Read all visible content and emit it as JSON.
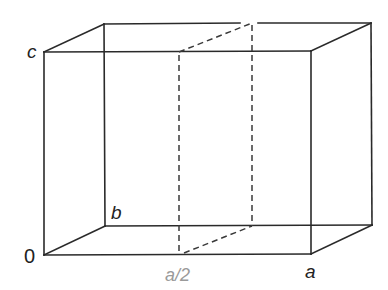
{
  "diagram": {
    "type": "unit-cell-box",
    "colors": {
      "edges": "#2a2a2a",
      "dashed_plane": "#3a3a3a",
      "half_label": "#9a9a9a",
      "background": "#ffffff"
    },
    "vertices": {
      "origin": [
        44,
        255
      ],
      "a": [
        311,
        254
      ],
      "b": [
        105,
        226
      ],
      "c": [
        44,
        52
      ],
      "ab": [
        372,
        225
      ],
      "ac": [
        311,
        51
      ],
      "bc": [
        104,
        24
      ],
      "abc": [
        371,
        23
      ],
      "half_front_bottom": [
        179,
        255
      ],
      "half_front_top": [
        179,
        52
      ],
      "half_back_bottom": [
        252,
        226
      ],
      "half_back_top": [
        252,
        23
      ]
    },
    "labels": {
      "origin": "0",
      "a": "a",
      "b": "b",
      "c": "c",
      "half_a": "a/2"
    }
  }
}
